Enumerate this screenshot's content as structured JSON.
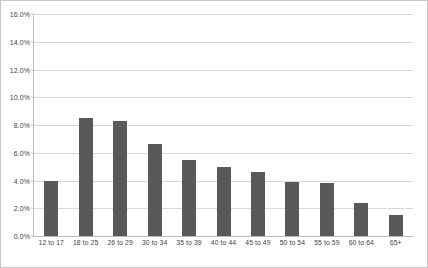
{
  "chart_data": {
    "type": "bar",
    "title": "",
    "xlabel": "",
    "ylabel": "",
    "categories": [
      "12 to 17",
      "18 to 25",
      "26 to 29",
      "30 to 34",
      "35 to 39",
      "40 to 44",
      "45 to 49",
      "50 to 54",
      "55 to 59",
      "60 to 64",
      "65+"
    ],
    "values": [
      4.0,
      8.5,
      8.3,
      6.6,
      5.5,
      5.0,
      4.6,
      3.9,
      3.85,
      2.4,
      1.5
    ],
    "value_labels": [
      "4.0%",
      "8.5%",
      "8.3%",
      "6.6%",
      "5.5%",
      "5.0%",
      "4.6%",
      "3.9%",
      "3.9%",
      "2.4%",
      "1.5%"
    ],
    "ylim": [
      0,
      16
    ],
    "ytick_labels": [
      "0.0%",
      "2.0%",
      "4.0%",
      "6.0%",
      "8.0%",
      "10.0%",
      "12.0%",
      "14.0%",
      "16.0%"
    ],
    "ytick_values": [
      0,
      2,
      4,
      6,
      8,
      10,
      12,
      14,
      16
    ],
    "grid": true,
    "legend": false,
    "colors": {
      "bar": "#595959",
      "gridline": "#d9d9d9",
      "axis": "#bfbfbf",
      "tick_text": "#3f3f3f",
      "background": "#ffffff",
      "border": "#c8c8c8"
    }
  }
}
